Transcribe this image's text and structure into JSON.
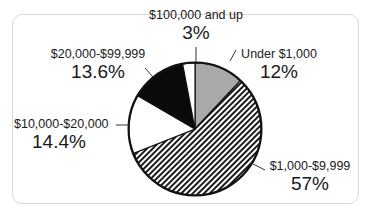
{
  "chart_data": {
    "type": "pie",
    "title": "",
    "start_angle_deg": 0,
    "direction": "clockwise",
    "categories": [
      "Under $1,000",
      "$1,000-$9,999",
      "$10,000-$20,000",
      "$20,000-$99,999",
      "$100,000 and up"
    ],
    "values": [
      12,
      57,
      14.4,
      13.6,
      3
    ],
    "value_labels": [
      "12%",
      "57%",
      "14.4%",
      "13.6%",
      "3%"
    ],
    "fills": [
      "gray",
      "diagonal-hatch",
      "white",
      "black",
      "white"
    ],
    "colors": [
      "#a9a9a9",
      "#222222",
      "#ffffff",
      "#0a0a0a",
      "#ffffff"
    ],
    "legend": "none (direct labels with leader lines)"
  },
  "labels": {
    "under_1000": {
      "name": "Under $1,000",
      "pct": "12%"
    },
    "k1_9999": {
      "name": "$1,000-$9,999",
      "pct": "57%"
    },
    "k10_20000": {
      "name": "$10,000-$20,000",
      "pct": "14.4%"
    },
    "k20_99999": {
      "name": "$20,000-$99,999",
      "pct": "13.6%"
    },
    "k100_up": {
      "name": "$100,000 and up",
      "pct": "3%"
    }
  }
}
